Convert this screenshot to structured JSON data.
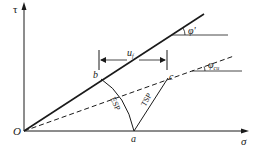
{
  "diagram": {
    "type": "stress-path",
    "axes": {
      "x_label": "σ",
      "y_label": "τ",
      "origin_label": "O"
    },
    "lines": {
      "effective_envelope_angle_label": "φ'",
      "total_envelope_angle_label_main": "φ",
      "total_envelope_angle_label_sub": "cu"
    },
    "points": {
      "a": "a",
      "b": "b",
      "c": "c"
    },
    "paths": {
      "esp": "ESP",
      "tsp": "TSP"
    },
    "dimension": {
      "main": "u",
      "sub": "f"
    },
    "colors": {
      "stroke": "#1a1a1a",
      "background": "#ffffff"
    }
  }
}
